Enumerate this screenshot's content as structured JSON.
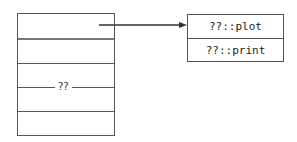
{
  "diagram": {
    "left_table": {
      "rows": 5,
      "middle_label": "??"
    },
    "right_table": {
      "cells": [
        {
          "text": "??::plot"
        },
        {
          "text": "??::print"
        }
      ]
    },
    "arrow": {
      "from": "left-table-first-cell",
      "to": "right-table"
    },
    "colors": {
      "line": "#555555",
      "text": "#222222",
      "background": "#ffffff"
    }
  }
}
